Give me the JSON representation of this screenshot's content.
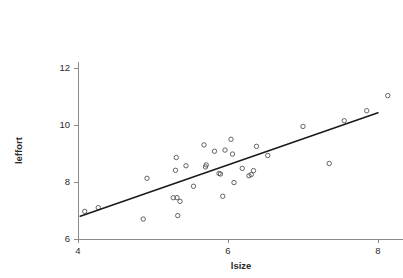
{
  "chart_data": {
    "type": "scatter",
    "title": "",
    "subtitle": "",
    "xlabel": "lsize",
    "ylabel": "leffort",
    "xlim": [
      3.85,
      8.35
    ],
    "ylim": [
      5.8,
      12.2
    ],
    "xticks": [
      4,
      6,
      8
    ],
    "xtick_labels": [
      "4",
      "6",
      "8"
    ],
    "yticks": [
      6,
      8,
      10,
      12
    ],
    "ytick_labels": [
      "6",
      "8",
      "10",
      "12"
    ],
    "grid": false,
    "legend": false,
    "legend_position": "none",
    "marker": "open-circle",
    "point_color": "#4a4a4a",
    "line_color": "#1a1a1a",
    "axis_color": "#8a8a8a",
    "background_color": "#ffffff",
    "annotations": [],
    "series": [
      {
        "name": "observations",
        "type": "scatter",
        "points": [
          [
            4.09,
            6.97
          ],
          [
            4.27,
            7.1
          ],
          [
            4.87,
            6.7
          ],
          [
            4.92,
            8.13
          ],
          [
            5.27,
            7.45
          ],
          [
            5.32,
            7.45
          ],
          [
            5.3,
            8.41
          ],
          [
            5.31,
            8.86
          ],
          [
            5.33,
            6.82
          ],
          [
            5.36,
            7.32
          ],
          [
            5.44,
            8.57
          ],
          [
            5.54,
            7.85
          ],
          [
            5.68,
            9.3
          ],
          [
            5.7,
            8.53
          ],
          [
            5.71,
            8.6
          ],
          [
            5.82,
            9.08
          ],
          [
            5.88,
            8.3
          ],
          [
            5.9,
            8.28
          ],
          [
            5.93,
            7.5
          ],
          [
            5.96,
            9.12
          ],
          [
            6.04,
            9.5
          ],
          [
            6.06,
            8.98
          ],
          [
            6.08,
            7.98
          ],
          [
            6.19,
            8.48
          ],
          [
            6.28,
            8.22
          ],
          [
            6.31,
            8.26
          ],
          [
            6.34,
            8.4
          ],
          [
            6.38,
            9.25
          ],
          [
            6.53,
            8.93
          ],
          [
            7.0,
            9.95
          ],
          [
            7.35,
            8.65
          ],
          [
            7.55,
            10.15
          ],
          [
            7.85,
            10.5
          ],
          [
            8.13,
            11.03
          ]
        ]
      },
      {
        "name": "regression-fit",
        "type": "line",
        "points": [
          [
            4.03,
            6.8
          ],
          [
            8.0,
            10.43
          ]
        ]
      }
    ]
  }
}
